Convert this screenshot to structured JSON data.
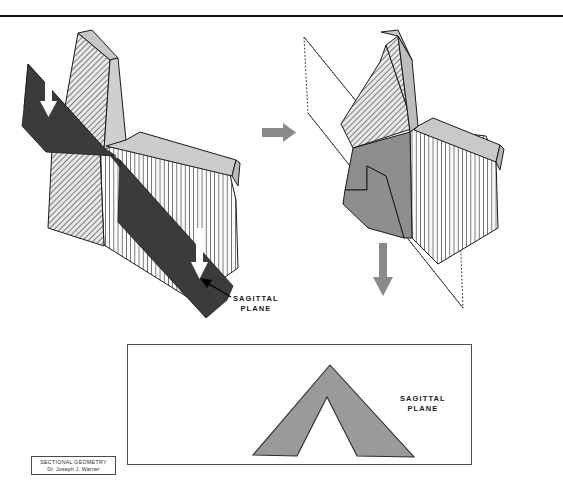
{
  "document": {
    "domain": "Diagram",
    "background_color": "#ffffff",
    "width": 563,
    "height": 500
  },
  "top_rule": {
    "name": "horizontal-divider-rule",
    "color": "#111111",
    "y": 15
  },
  "labels": {
    "left_figure_callout": "SAGITTAL\nPLANE",
    "panel_caption": "SAGITTAL\nPLANE"
  },
  "title_block": {
    "line1": "SECTIONAL GEOMETRY",
    "line2": "Dr. Joseph J. Warner",
    "border_color": "#4a4a4a"
  },
  "panel": {
    "name": "sagittal-section-panel",
    "border_color": "#4d4d4d",
    "fill": "#ffffff"
  },
  "colors": {
    "dark_plane": "#3b3b3b",
    "mid_gray": "#8e8e8e",
    "light_gray": "#c9c9c9",
    "pale_gray": "#d8d8d8",
    "hatch_line": "#555555",
    "outline": "#1a1a1a",
    "arrow_gray": "#8a8a8a",
    "arrow_white": "#ffffff",
    "chevron_fill": "#9a9a9a",
    "dotted_plane": "#333333"
  },
  "figures": {
    "left": {
      "name": "figure-left-cut-solid-with-sagittal-plane",
      "description": "3D hatched wedge solid intersected by a dark sagittal cutting plane",
      "arrows": [
        {
          "name": "white-down-arrow-upper",
          "direction": "down",
          "color": "#ffffff"
        },
        {
          "name": "white-down-arrow-lower",
          "direction": "down",
          "color": "#ffffff"
        }
      ],
      "callout_arrow": {
        "name": "callout-leader-arrow",
        "color": "#000000"
      }
    },
    "right": {
      "name": "figure-right-solid-with-dotted-plane",
      "description": "Same 3D solid shown with the sagittal plane drawn as a dotted outline",
      "plane_style": "dotted"
    },
    "panel_section": {
      "name": "sagittal-section-chevron",
      "description": "Resulting chevron-shaped section profile in the sagittal plane",
      "fill": "#9a9a9a"
    }
  },
  "process_arrows": [
    {
      "name": "process-arrow-right",
      "direction": "right",
      "color": "#8a8a8a"
    },
    {
      "name": "process-arrow-down",
      "direction": "down",
      "color": "#8a8a8a"
    }
  ]
}
